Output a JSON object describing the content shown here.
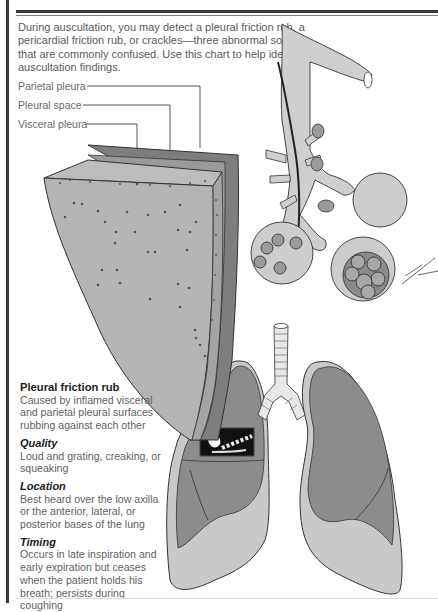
{
  "intro": {
    "text": "During auscultation, you may detect a pleural friction rub, a pericardial friction rub, or crackles—three abnormal sounds that are commonly confused. Use this chart to help identify auscultation findings."
  },
  "diagram_labels": {
    "parietal_pleura": "Parietal pleura",
    "pleural_space": "Pleural space",
    "visceral_pleura": "Visceral pleura"
  },
  "sidebar": {
    "title": "Pleural friction rub",
    "description": "Caused by inflamed visceral and parietal pleural surfaces rubbing against each other",
    "sections": [
      {
        "heading": "Quality",
        "text": "Loud and grating, creaking, or squeaking"
      },
      {
        "heading": "Location",
        "text": "Best heard over the low axilla or the anterior, lateral, or posterior bases of the lung"
      },
      {
        "heading": "Timing",
        "text": "Occurs in late inspiration and early expiration but ceases when the patient holds his breath; persists during coughing"
      }
    ]
  },
  "colors": {
    "rule": "#3a3a3a",
    "pleura_light": "#b8b8b8",
    "pleura_mid": "#9a9a9a",
    "pleura_dark": "#7e7e7e",
    "lung_outer": "#c9c9c9",
    "lung_inner": "#8c8c8c",
    "bronchi": "#cfcfcf"
  }
}
